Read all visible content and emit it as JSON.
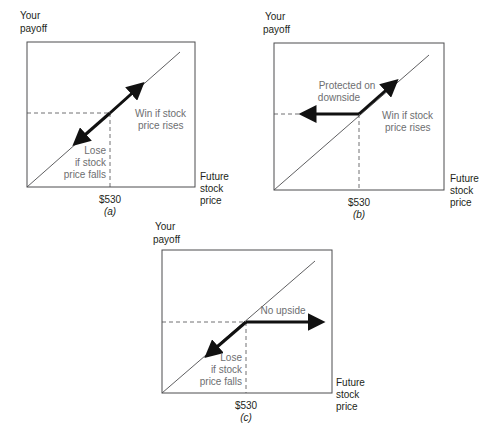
{
  "colors": {
    "axis": "#4d4d4f",
    "line": "#4d4d4f",
    "arrow": "#111111",
    "text": "#231f20",
    "annotation": "#6d6e70"
  },
  "panels": [
    {
      "tag": "(a)",
      "y_axis_label": [
        "Your",
        "payoff"
      ],
      "x_axis_label": [
        "Future",
        "stock",
        "price"
      ],
      "strike_label": "$530",
      "annotations": [
        {
          "id": "win",
          "lines": [
            "Win if stock",
            "price rises"
          ]
        },
        {
          "id": "lose",
          "lines": [
            "Lose",
            "if stock",
            "price falls"
          ]
        }
      ]
    },
    {
      "tag": "(b)",
      "y_axis_label": [
        "Your",
        "payoff"
      ],
      "x_axis_label": [
        "Future",
        "stock",
        "price"
      ],
      "strike_label": "$530",
      "annotations": [
        {
          "id": "protected",
          "lines": [
            "Protected on",
            "downside"
          ]
        },
        {
          "id": "win",
          "lines": [
            "Win if stock",
            "price rises"
          ]
        }
      ]
    },
    {
      "tag": "(c)",
      "y_axis_label": [
        "Your",
        "payoff"
      ],
      "x_axis_label": [
        "Future",
        "stock",
        "price"
      ],
      "strike_label": "$530",
      "annotations": [
        {
          "id": "no-upside",
          "lines": [
            "No upside"
          ]
        },
        {
          "id": "lose",
          "lines": [
            "Lose",
            "if stock",
            "price falls"
          ]
        }
      ]
    }
  ]
}
